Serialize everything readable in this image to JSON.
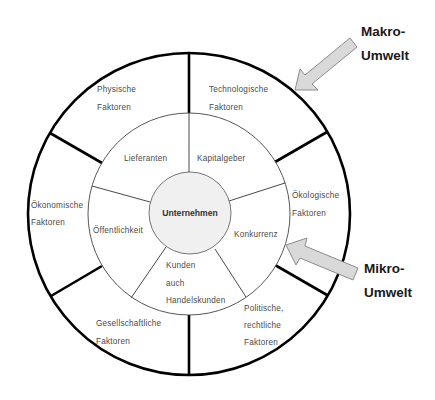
{
  "diagram": {
    "center": {
      "label": "Unternehmen"
    },
    "micro_environment": {
      "segments": [
        {
          "lines": [
            "Kapitalgeber"
          ]
        },
        {
          "lines": [
            "Konkurrenz"
          ]
        },
        {
          "lines": [
            "Kunden",
            "auch",
            "Handelskunden"
          ]
        },
        {
          "lines": [
            "Öffentlichkeit"
          ]
        },
        {
          "lines": [
            "Lieferanten"
          ]
        }
      ]
    },
    "macro_environment": {
      "segments": [
        {
          "lines": [
            "Technologische",
            "Faktoren"
          ]
        },
        {
          "lines": [
            "Ökologische",
            "Faktoren"
          ]
        },
        {
          "lines": [
            "Politische,",
            "rechtliche",
            "Faktoren"
          ]
        },
        {
          "lines": [
            "Gesellschaftliche",
            "Faktoren"
          ]
        },
        {
          "lines": [
            "Ökonomische",
            "Faktoren"
          ]
        },
        {
          "lines": [
            "Physische",
            "Faktoren"
          ]
        }
      ]
    },
    "callouts": {
      "makro": {
        "line1": "Makro-",
        "line2": "Umwelt"
      },
      "mikro": {
        "line1": "Mikro-",
        "line2": "Umwelt"
      }
    },
    "colors": {
      "arrow_fill": "#d9d9d9",
      "arrow_stroke": "#8c8c8c",
      "center_fill": "#f0f0f0",
      "line": "#000000"
    }
  }
}
